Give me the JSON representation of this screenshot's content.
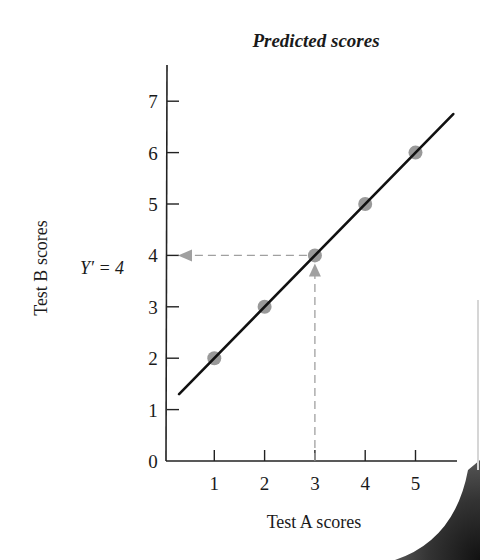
{
  "chart_data": {
    "type": "scatter",
    "title": "Predicted scores",
    "xlabel": "Test A scores",
    "ylabel": "Test B scores",
    "xlim": [
      0,
      5.8
    ],
    "ylim": [
      0,
      7.5
    ],
    "x_ticks": [
      1,
      2,
      3,
      4,
      5
    ],
    "y_ticks": [
      0,
      1,
      2,
      3,
      4,
      5,
      6,
      7
    ],
    "grid": false,
    "legend": null,
    "series": [
      {
        "name": "Scores",
        "type": "scatter",
        "x": [
          1,
          2,
          3,
          4,
          5
        ],
        "y": [
          2,
          3,
          4,
          5,
          6
        ],
        "color": "#999999"
      },
      {
        "name": "Regression line",
        "type": "line",
        "equation": "Y' = X + 1",
        "x": [
          0.3,
          5.75
        ],
        "y": [
          1.3,
          6.75
        ],
        "color": "#111111"
      }
    ],
    "annotations": [
      {
        "text": "Y' = 4",
        "x_value": 3,
        "y_value": 4,
        "description": "Dashed arrows from X=3 up to the line and across to Y axis at 4",
        "color": "#999999"
      }
    ]
  },
  "labels": {
    "title": "Predicted scores",
    "xlabel": "Test A scores",
    "ylabel": "Test B scores",
    "annotation": "Y′ = 4"
  }
}
